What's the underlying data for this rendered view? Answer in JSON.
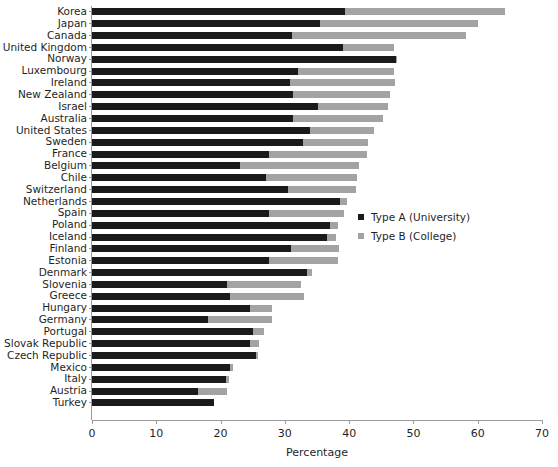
{
  "chart_data": {
    "type": "bar",
    "orientation": "horizontal",
    "stacked": true,
    "title": "",
    "xlabel": "Percentage",
    "ylabel": "",
    "xlim": [
      0,
      70
    ],
    "xticks": [
      0,
      10,
      20,
      30,
      40,
      50,
      60,
      70
    ],
    "grid": false,
    "legend_position": "center-right",
    "categories": [
      "Korea",
      "Japan",
      "Canada",
      "United Kingdom",
      "Norway",
      "Luxembourg",
      "Ireland",
      "New Zealand",
      "Israel",
      "Australia",
      "United States",
      "Sweden",
      "France",
      "Belgium",
      "Chile",
      "Switzerland",
      "Netherlands",
      "Spain",
      "Poland",
      "Iceland",
      "Finland",
      "Estonia",
      "Denmark",
      "Slovenia",
      "Greece",
      "Hungary",
      "Germany",
      "Portugal",
      "Slovak Republic",
      "Czech Republic",
      "Mexico",
      "Italy",
      "Austria",
      "Turkey"
    ],
    "series": [
      {
        "name": "Type A (University)",
        "color": "#1a1a1a",
        "values": [
          39.3,
          35.5,
          31.1,
          39.0,
          47.3,
          32.0,
          30.8,
          31.2,
          35.2,
          31.2,
          33.9,
          32.8,
          27.5,
          23.0,
          27.0,
          30.5,
          38.5,
          27.5,
          37.0,
          36.5,
          31.0,
          27.5,
          33.5,
          21.0,
          21.5,
          24.5,
          18.0,
          25.0,
          24.5,
          25.5,
          21.5,
          20.8,
          16.5,
          19.0
        ]
      },
      {
        "name": "Type B (College)",
        "color": "#a3a3a3",
        "values": [
          24.9,
          24.5,
          27.1,
          8.0,
          0.2,
          15.0,
          16.3,
          15.2,
          10.8,
          14.1,
          9.9,
          10.2,
          15.3,
          18.5,
          14.3,
          10.5,
          1.2,
          11.7,
          1.2,
          1.5,
          7.5,
          10.8,
          0.8,
          11.5,
          11.5,
          3.5,
          10.0,
          1.8,
          1.5,
          0.4,
          0.4,
          0.5,
          4.5,
          0.0
        ]
      }
    ],
    "totals": [
      64.2,
      60.0,
      58.2,
      47.0,
      47.5,
      47.0,
      47.1,
      46.4,
      46.0,
      45.3,
      43.8,
      43.0,
      42.8,
      41.5,
      41.3,
      41.0,
      39.7,
      39.2,
      38.2,
      38.0,
      38.5,
      38.3,
      34.3,
      32.5,
      33.0,
      28.0,
      28.0,
      26.8,
      26.0,
      25.9,
      21.9,
      21.3,
      21.0,
      19.0
    ]
  },
  "legend": {
    "items": [
      {
        "label": "Type A (University)",
        "swatch": "dark-square-swatch"
      },
      {
        "label": "Type B (College)",
        "swatch": "gray-square-swatch"
      }
    ]
  },
  "axis": {
    "x_title": "Percentage",
    "x_tick_labels": [
      "0",
      "10",
      "20",
      "30",
      "40",
      "50",
      "60",
      "70"
    ]
  }
}
